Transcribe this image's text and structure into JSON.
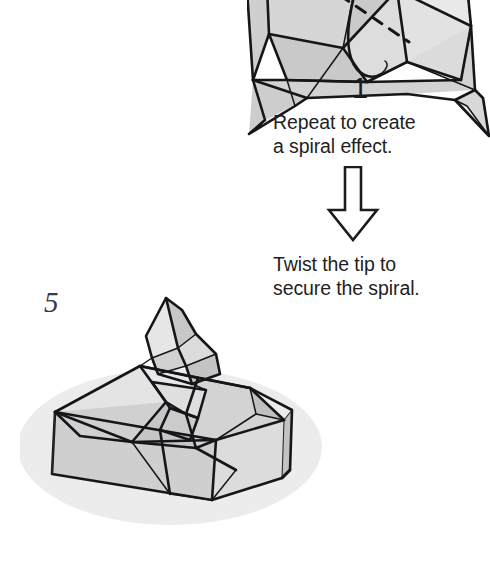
{
  "page": {
    "domain": "origami-instruction-page",
    "background_color": "#ffffff",
    "ink_color": "#16161a"
  },
  "steps": [
    {
      "number_label": "1",
      "figure_name": "origami-step-1-diagram",
      "description": "Partially folded square base seen from above with a curved valley fold, a dashed reference line and a solid black fold arrow pointing left toward the centre.",
      "annotations": {
        "fold_arrow": "solid-black-arrow-pointing-left",
        "dashed_line": "dashed-reference-crease"
      },
      "palette": {
        "paper_light": "#efefef",
        "paper_mid": "#d9d9d9",
        "paper_dark": "#bcbcbc",
        "paper_shade": "#cfcfcf"
      }
    },
    {
      "number_label": "5",
      "figure_name": "origami-step-5-diagram",
      "description": "Finished square spiral box shown in three-quarter view with a twisted pointed tip at the apex and a soft drop shadow underneath.",
      "annotations": {
        "drop_shadow": "soft-grey-ellipse-shadow"
      },
      "palette": {
        "paper_light": "#ececec",
        "paper_mid": "#d4d4d4",
        "paper_dark": "#b9b9b9",
        "paper_side": "#c9c9c9",
        "shadow": "#ebebec"
      }
    }
  ],
  "captions": {
    "repeat": "Repeat to create\na spiral effect.",
    "twist": "Twist the tip to\nsecure the spiral."
  },
  "flow_arrow": {
    "icon_name": "down-arrow-icon",
    "direction": "down",
    "style": "hollow-outlined",
    "stroke_color": "#1b1b1f",
    "fill_color": "#ffffff"
  }
}
